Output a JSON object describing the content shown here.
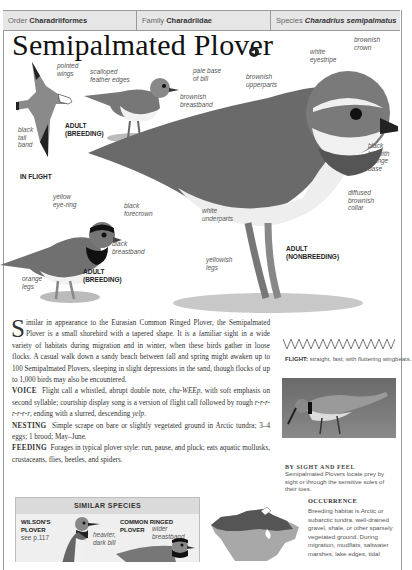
{
  "taxonomy": {
    "order_key": "Order",
    "order_value": "Charadriiformes",
    "family_key": "Family",
    "family_value": "Charadriidae",
    "species_key": "Species",
    "species_value": "Charadrius semipalmatus"
  },
  "title": "Semipalmated Plover",
  "sound_icon": "speaker-icon",
  "illustrations": {
    "in_flight": {
      "labels": [
        "pointed wings",
        "black tail band"
      ],
      "caption_age": "ADULT (BREEDING)",
      "caption": "IN FLIGHT"
    },
    "juvenile": {
      "labels": [
        "scalloped feather edges",
        "pale base of bill",
        "brownish breastband"
      ],
      "caption": "JUVENILE"
    },
    "adult_nonbreeding": {
      "labels": [
        "white eyestripe",
        "brownish crown",
        "brownish upperparts",
        "black bill with orange base",
        "diffused brownish collar",
        "white underparts",
        "yellowish legs"
      ],
      "caption_line1": "ADULT",
      "caption_line2": "(NONBREEDING)"
    },
    "adult_breeding": {
      "labels": [
        "yellow eye-ring",
        "black forecrown",
        "black breastband",
        "orange legs"
      ],
      "caption_line1": "ADULT",
      "caption_line2": "(BREEDING)"
    }
  },
  "description": {
    "dropcap": "S",
    "intro": "imilar in appearance to the Eurasian Common Ringed Plover, the Semipalmated Plover is a small shorebird with a tapered shape. It is a familiar sight in a wide variety of habitats during migration and in winter, when these birds gather in loose flocks. A casual walk down a sandy beach between fall and spring might awaken up to 100 Semipalmated Plovers, sleeping in slight depressions in the sand, though flocks of up to 1,000 birds may also be encountered.",
    "voice_head": "VOICE",
    "voice_text_1": "Flight call a whistled, abrupt double note, ",
    "voice_call": "chu-WEEp",
    "voice_text_2": ", with soft emphasis on second syllable; courtship display song is a version of flight call followed by rough ",
    "voice_rough": "r-r-r-r-r-r-r",
    "voice_text_3": ", ending with a slurred, descending ",
    "voice_end": "yelp",
    "voice_text_4": ".",
    "nesting_head": "NESTING",
    "nesting_text": "Simple scrape on bare or slightly vegetated ground in Arctic tundra; 3–4 eggs; 1 brood; May–June.",
    "feeding_head": "FEEDING",
    "feeding_text": "Forages in typical plover style: run, pause, and pluck; eats aquatic mollusks, crustaceans, flies, beetles, and spiders."
  },
  "flight": {
    "label": "FLIGHT:",
    "text": "straight, fast; with fluttering wingbeats."
  },
  "photo": {
    "title": "BY SIGHT AND FEEL",
    "caption": "Semipalmated Plovers locate prey by sight or through the sensitive soles of their toes."
  },
  "occurrence": {
    "title": "OCCURRENCE",
    "text": "Breeding habitat is Arctic or subarctic tundra, well-drained gravel, shale, or other sparsely vegetated ground. During migration, mudflats, saltwater marshes, lake edges, tidal"
  },
  "similar_species": {
    "heading": "SIMILAR SPECIES",
    "items": [
      {
        "name_line1": "WILSON'S",
        "name_line2": "PLOVER",
        "ref": "see p.117",
        "note_line1": "heavier,",
        "note_line2": "dark bill"
      },
      {
        "name_line1": "COMMON RINGED",
        "name_line2": "PLOVER",
        "ref": "",
        "note_line1": "wider",
        "note_line2": "breastband"
      }
    ]
  },
  "colors": {
    "taxo_bg": "#e6e6e6",
    "frame": "#9a9a9a",
    "map_breeding": "#555555",
    "map_range": "#a8a8a8"
  }
}
